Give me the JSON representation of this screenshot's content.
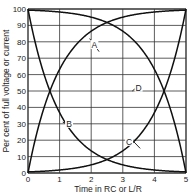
{
  "chart_data": {
    "type": "line",
    "title": "",
    "xlabel": "Time in RC or L/R",
    "ylabel": "Per cent of full voltage or current",
    "xlim": [
      0,
      5
    ],
    "ylim": [
      0,
      100
    ],
    "x_ticks": [
      "0",
      "1",
      "2",
      "3",
      "4",
      "5"
    ],
    "y_ticks": [
      "0",
      "10",
      "20",
      "30",
      "40",
      "50",
      "60",
      "70",
      "80",
      "90",
      "100"
    ],
    "grid": true,
    "x": [
      0,
      0.5,
      1,
      1.5,
      2,
      2.5,
      3,
      3.5,
      4,
      4.5,
      5
    ],
    "series": [
      {
        "name": "A",
        "values": [
          0,
          39,
          63,
          78,
          86,
          92,
          95,
          97,
          98,
          99,
          99
        ]
      },
      {
        "name": "B",
        "values": [
          100,
          61,
          37,
          22,
          14,
          8,
          5,
          3,
          2,
          1,
          1
        ]
      },
      {
        "name": "C",
        "values": [
          1,
          1,
          2,
          3,
          5,
          8,
          14,
          22,
          37,
          61,
          100
        ]
      },
      {
        "name": "D",
        "values": [
          99,
          99,
          98,
          97,
          95,
          92,
          86,
          78,
          63,
          39,
          0
        ]
      }
    ],
    "annotations": [
      {
        "label": "A",
        "x": 2.1,
        "y": 78
      },
      {
        "label": "B",
        "x": 1.3,
        "y": 30
      },
      {
        "label": "C",
        "x": 3.2,
        "y": 19
      },
      {
        "label": "D",
        "x": 3.5,
        "y": 52
      }
    ]
  }
}
